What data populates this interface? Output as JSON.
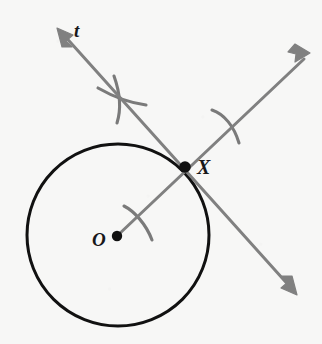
{
  "figure": {
    "background_color": "#f7f7f6",
    "width": 322,
    "height": 344,
    "labels": {
      "tangent_line": "t",
      "tangent_point": "X",
      "circle_center": "O"
    },
    "colors": {
      "circle_stroke": "#111111",
      "construction_line": "#808080",
      "arc_mark": "#7a7a7a",
      "point_dot": "#111111",
      "label_text": "#18181a"
    },
    "circle": {
      "center_x": 118,
      "center_y": 235,
      "radius": 91,
      "stroke_width": 3.0
    },
    "points": [
      {
        "name": "O",
        "role": "center",
        "x": 117,
        "y": 236,
        "dot_radius": 5.2
      },
      {
        "name": "X",
        "role": "point-of-tangency",
        "x": 185,
        "y": 167,
        "dot_radius": 5.8
      }
    ],
    "lines": [
      {
        "name": "tangent-line-t",
        "role": "tangent",
        "x1": 57,
        "y1": 28,
        "x2": 297,
        "y2": 295,
        "stroke_width": 3.0,
        "arrowheads": "both"
      },
      {
        "name": "radius-ray",
        "role": "perpendicular-radius-extended",
        "x1": 117,
        "y1": 236,
        "x2": 310,
        "y2": 53,
        "stroke_width": 3.0,
        "arrowheads": "end"
      }
    ],
    "arc_marks": [
      {
        "name": "arc-mark-upper-left",
        "cx": 121,
        "cy": 99,
        "note": "compass arc crossing line t above circle"
      },
      {
        "name": "cross-mark-upper-left",
        "cx": 121,
        "cy": 99,
        "note": "second compass arc forming an X"
      },
      {
        "name": "arc-mark-upper-right",
        "cx": 228,
        "cy": 123,
        "note": "compass arc crossing the ray above X"
      },
      {
        "name": "arc-mark-lower-left",
        "cx": 137,
        "cy": 222,
        "note": "compass arc crossing the ray inside circle"
      }
    ],
    "label_positions": {
      "t": {
        "x": 82,
        "y": 32
      },
      "X": {
        "x": 205,
        "y": 168
      },
      "O": {
        "x": 100,
        "y": 241
      }
    }
  }
}
